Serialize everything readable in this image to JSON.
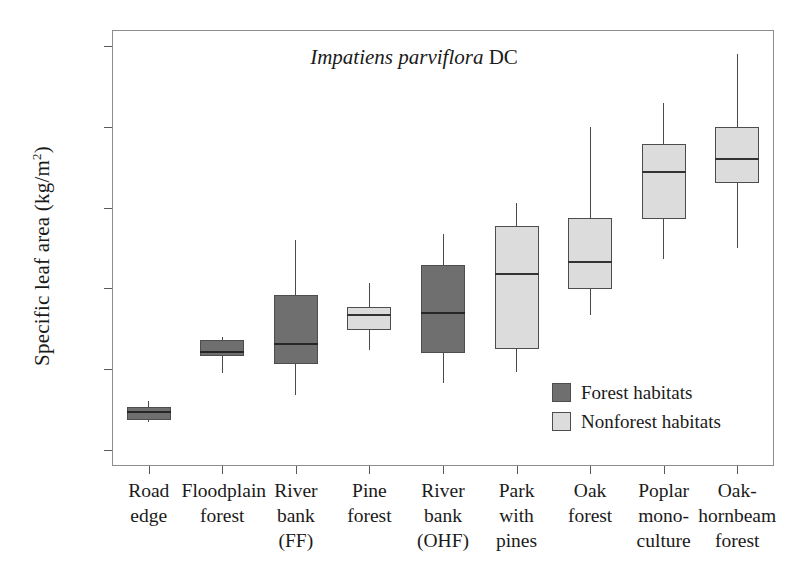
{
  "chart_data": {
    "type": "box",
    "title": "Impatiens parviflora DC",
    "title_species": "Impatiens parviflora",
    "title_authority": "DC",
    "xlabel": "",
    "ylabel": "Specific leaf area (kg/m2)",
    "ylabel_main": "Specific leaf area (kg/m",
    "ylabel_exponent": "2",
    "ylabel_close": ")",
    "ylim": [
      56,
      164
    ],
    "yticks": [
      60,
      80,
      100,
      120,
      140,
      160
    ],
    "ytick_labels": [
      "60",
      "80",
      "100",
      "120",
      "140",
      "160"
    ],
    "grid": false,
    "legend_position": "inside-lower-right",
    "categories": [
      "Road edge",
      "Floodplain forest",
      "River bank (FF)",
      "Pine forest",
      "River bank (OHF)",
      "Park with pines",
      "Oak forest",
      "Poplar monoculture",
      "Oak-hornbeam forest"
    ],
    "category_label_lines": [
      [
        "Road",
        "edge"
      ],
      [
        "Floodplain",
        "forest"
      ],
      [
        "River",
        "bank",
        "(FF)"
      ],
      [
        "Pine",
        "forest"
      ],
      [
        "River",
        "bank",
        "(OHF)"
      ],
      [
        "Park",
        "with",
        "pines"
      ],
      [
        "Oak",
        "forest"
      ],
      [
        "Poplar",
        "mono-",
        "culture"
      ],
      [
        "Oak-",
        "hornbeam",
        "forest"
      ]
    ],
    "boxes": [
      {
        "category": "Road edge",
        "group": "forest",
        "whisker_low": 67.0,
        "q1": 67.3,
        "median": 69.3,
        "q3": 70.6,
        "whisker_high": 72.0
      },
      {
        "category": "Floodplain forest",
        "group": "forest",
        "whisker_low": 79.0,
        "q1": 83.2,
        "median": 84.2,
        "q3": 87.2,
        "whisker_high": 88.0
      },
      {
        "category": "River bank (FF)",
        "group": "forest",
        "whisker_low": 73.5,
        "q1": 81.2,
        "median": 86.2,
        "q3": 98.3,
        "whisker_high": 112.0
      },
      {
        "category": "Pine forest",
        "group": "nonforest",
        "whisker_low": 84.8,
        "q1": 89.7,
        "median": 93.5,
        "q3": 95.5,
        "whisker_high": 101.3
      },
      {
        "category": "River bank (OHF)",
        "group": "forest",
        "whisker_low": 76.6,
        "q1": 83.9,
        "median": 94.0,
        "q3": 105.8,
        "whisker_high": 113.4
      },
      {
        "category": "Park with pines",
        "group": "nonforest",
        "whisker_low": 79.4,
        "q1": 85.0,
        "median": 103.6,
        "q3": 115.5,
        "whisker_high": 121.1
      },
      {
        "category": "Oak forest",
        "group": "nonforest",
        "whisker_low": 93.5,
        "q1": 99.8,
        "median": 106.6,
        "q3": 117.5,
        "whisker_high": 139.9
      },
      {
        "category": "Poplar monoculture",
        "group": "nonforest",
        "whisker_low": 107.2,
        "q1": 117.2,
        "median": 128.8,
        "q3": 135.8,
        "whisker_high": 145.9
      },
      {
        "category": "Oak-hornbeam forest",
        "group": "nonforest",
        "whisker_low": 110.0,
        "q1": 126.0,
        "median": 132.0,
        "q3": 140.0,
        "whisker_high": 158.0
      }
    ],
    "legend": [
      {
        "key": "forest",
        "label": "Forest habitats",
        "color": "#6f6f6f"
      },
      {
        "key": "nonforest",
        "label": "Nonforest habitats",
        "color": "#dcdcdc"
      }
    ],
    "colors": {
      "forest": "#6f6f6f",
      "nonforest": "#dcdcdc",
      "outline": "#4d4d4d",
      "axis": "#8d8d8d",
      "text": "#1a1a1a"
    }
  }
}
